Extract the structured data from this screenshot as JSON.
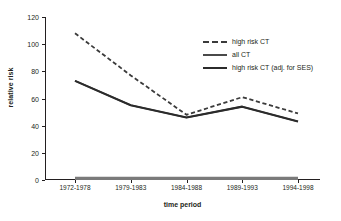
{
  "chart_data": {
    "type": "line",
    "title": "",
    "xlabel": "time period",
    "ylabel": "relative risk",
    "categories": [
      "1972-1978",
      "1979-1983",
      "1984-1988",
      "1989-1993",
      "1994-1998"
    ],
    "ylim": [
      0,
      120
    ],
    "yticks": [
      0,
      20,
      40,
      60,
      80,
      100,
      120
    ],
    "grid": false,
    "legend_position": "upper right",
    "series": [
      {
        "name": "high risk CT",
        "style": "dashed",
        "color": "#3b3b3b",
        "values": [
          108,
          77,
          48,
          61,
          49
        ]
      },
      {
        "name": "all CT",
        "style": "solid",
        "color": "#4a4a4a",
        "values": [
          73,
          55,
          46,
          54,
          43
        ]
      },
      {
        "name": "high risk CT (adj. for SES)",
        "style": "solid-thick",
        "color": "#2b2b2b",
        "values": [
          73,
          55,
          46,
          54,
          43
        ]
      },
      {
        "name": "baseline",
        "style": "baseline-band",
        "color": "#7a7a7a",
        "values": [
          0,
          0,
          0,
          0,
          0
        ]
      }
    ]
  },
  "legend": {
    "items": [
      {
        "label": "high risk CT",
        "swatch": "dashed-line-swatch"
      },
      {
        "label": "all CT",
        "swatch": "solid-thin-line-swatch"
      },
      {
        "label": "high risk CT (adj. for SES)",
        "swatch": "solid-thick-line-swatch"
      }
    ]
  },
  "axes": {
    "y_title": "relative risk",
    "x_title": "time period",
    "y_tick_labels": [
      "120",
      "100",
      "80",
      "60",
      "40",
      "20",
      "0"
    ],
    "x_tick_labels": [
      "1972-1978",
      "1979-1983",
      "1984-1988",
      "1989-1993",
      "1994-1998"
    ]
  }
}
